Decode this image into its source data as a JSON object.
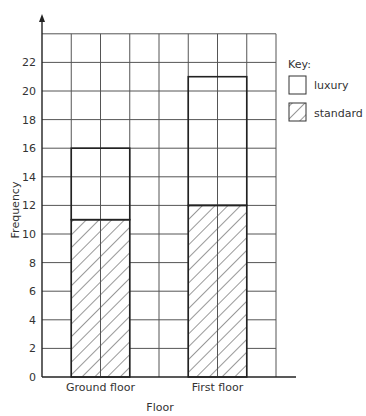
{
  "chart_data": {
    "type": "bar",
    "stacked": true,
    "title": "",
    "xlabel": "Floor",
    "ylabel": "Frequency",
    "categories": [
      "Ground floor",
      "First floor"
    ],
    "series": [
      {
        "name": "standard",
        "values": [
          11,
          12
        ],
        "pattern": "hatched"
      },
      {
        "name": "luxury",
        "values": [
          5,
          9
        ],
        "pattern": "blank"
      }
    ],
    "totals": [
      16,
      21
    ],
    "ylim": [
      0,
      24
    ],
    "yticks": [
      0,
      2,
      4,
      6,
      8,
      10,
      12,
      14,
      16,
      18,
      20,
      22
    ],
    "grid": true,
    "legend": {
      "title": "Key:",
      "position": "right",
      "entries": [
        {
          "label": "luxury",
          "pattern": "blank"
        },
        {
          "label": "standard",
          "pattern": "hatched"
        }
      ]
    }
  },
  "colors": {
    "grid": "#555555",
    "bar_outline": "#222222",
    "hatch": "#333333",
    "text": "#333333"
  }
}
